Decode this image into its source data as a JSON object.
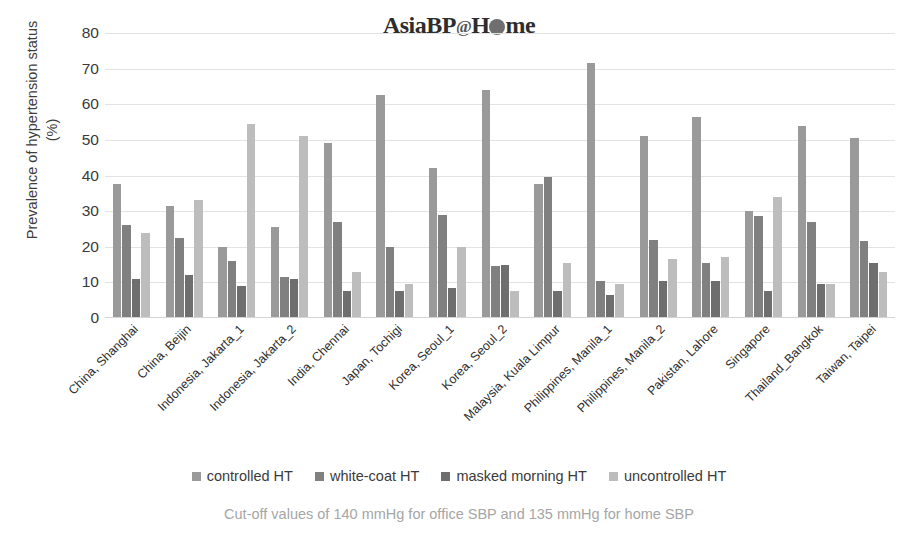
{
  "logo": {
    "text_a": "Asia",
    "text_b": "BP",
    "at": "@",
    "text_c": "H",
    "text_d": "me"
  },
  "caption": "Cut-off values of 140 mmHg for office SBP and 135 mmHg for home SBP",
  "legend": {
    "items": [
      {
        "label": "controlled HT",
        "color": "#9a9a9a"
      },
      {
        "label": "white-coat HT",
        "color": "#808080"
      },
      {
        "label": "masked morning HT",
        "color": "#6e6e6e"
      },
      {
        "label": "uncontrolled HT",
        "color": "#bdbdbd"
      }
    ]
  },
  "chart_data": {
    "type": "bar",
    "xlabel": "",
    "ylabel": "Prevalence of hypertension status (%)",
    "ylim": [
      0,
      80
    ],
    "yticks": [
      0,
      10,
      20,
      30,
      40,
      50,
      60,
      70,
      80
    ],
    "grid": true,
    "legend_position": "bottom",
    "categories": [
      "China, Shanghai",
      "China, Beijin",
      "Indonesia, Jakarta_1",
      "Indonesia, Jakarta_2",
      "India, Chennai",
      "Japan, Tochigi",
      "Korea, Seoul_1",
      "Korea, Seoul_2",
      "Malaysia, Kuala Limpur",
      "Philippines, Manila_1",
      "Philippines, Manila_2",
      "Pakistan, Lahore",
      "Singapore",
      "Thailand_Bangkok",
      "Taiwan, Taipei"
    ],
    "series": [
      {
        "name": "controlled HT",
        "color": "#9a9a9a",
        "values": [
          37.5,
          31.5,
          20.0,
          25.5,
          49.0,
          62.5,
          42.0,
          64.0,
          37.5,
          71.5,
          51.0,
          56.5,
          30.0,
          54.0,
          50.5
        ]
      },
      {
        "name": "white-coat HT",
        "color": "#808080",
        "values": [
          26.0,
          22.5,
          16.0,
          11.5,
          27.0,
          20.0,
          29.0,
          14.5,
          39.5,
          10.5,
          22.0,
          15.5,
          28.5,
          27.0,
          21.5
        ]
      },
      {
        "name": "masked morning HT",
        "color": "#6e6e6e",
        "values": [
          11.0,
          12.0,
          9.0,
          11.0,
          7.5,
          7.5,
          8.5,
          15.0,
          7.5,
          6.5,
          10.5,
          10.5,
          7.5,
          9.5,
          15.5
        ]
      },
      {
        "name": "uncontrolled HT",
        "color": "#bdbdbd",
        "values": [
          24.0,
          33.0,
          54.5,
          51.0,
          13.0,
          9.5,
          20.0,
          7.5,
          15.5,
          9.5,
          16.5,
          17.0,
          34.0,
          9.5,
          13.0
        ]
      }
    ]
  }
}
